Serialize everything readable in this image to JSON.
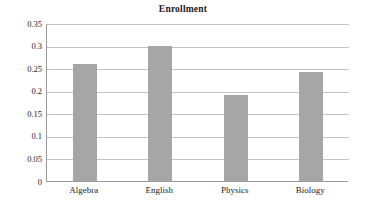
{
  "chart_data": {
    "type": "bar",
    "title": "Enrollment",
    "xlabel": "",
    "ylabel": "",
    "categories": [
      "Algebra",
      "English",
      "Physics",
      "Biology"
    ],
    "values": [
      0.26,
      0.3,
      0.19,
      0.242
    ],
    "ylim": [
      0,
      0.35
    ],
    "yticks": [
      "0",
      "0.05",
      "0.1",
      "0.15",
      "0.2",
      "0.25",
      "0.3",
      "0.35"
    ],
    "ytick_values": [
      0,
      0.05,
      0.1,
      0.15,
      0.2,
      0.25,
      0.3,
      0.35
    ],
    "grid": true,
    "legend": false,
    "bar_color": "#a6a6a6",
    "gridline_color": "#c3c3c3",
    "axis_color": "#9a9a9a",
    "text_color": "#1b1b1b"
  }
}
